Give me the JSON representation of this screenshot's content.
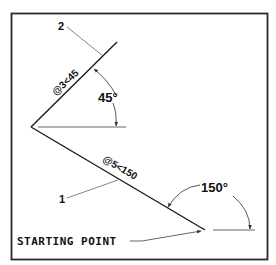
{
  "diagram": {
    "callouts": {
      "line1": "1",
      "line2": "2"
    },
    "dimensions": {
      "line1_polar": "@5<150",
      "line2_polar": "@3<45"
    },
    "angles": {
      "angle1": "150°",
      "angle2": "45°"
    },
    "start_label": "STARTING POINT"
  },
  "colors": {
    "stroke": "#1a1a1a",
    "leader": "#555555",
    "border": "#2a2a2a",
    "background": "#ffffff"
  }
}
